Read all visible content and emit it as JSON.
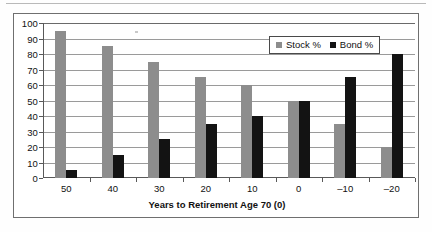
{
  "chart_data": {
    "type": "bar",
    "title": "",
    "xlabel": "Years to Retirement Age 70 (0)",
    "ylabel": "",
    "categories": [
      "50",
      "40",
      "30",
      "20",
      "10",
      "0",
      "–10",
      "–20"
    ],
    "series": [
      {
        "name": "Stock %",
        "color": "#8d8d8d",
        "values": [
          95,
          85,
          75,
          65,
          60,
          50,
          35,
          20
        ]
      },
      {
        "name": "Bond %",
        "color": "#131313",
        "values": [
          5,
          15,
          25,
          35,
          40,
          50,
          65,
          80
        ]
      }
    ],
    "ylim": [
      0,
      100
    ],
    "ytick_step": 10,
    "yticks": [
      "0",
      "10",
      "20",
      "30",
      "40",
      "50",
      "60",
      "70",
      "80",
      "90",
      "100"
    ],
    "grid": "horizontal",
    "legend_position": "top-right",
    "legend_entries": [
      "Stock %",
      "Bond %"
    ],
    "annotations": []
  },
  "figure": {
    "frame_border_color": "#6f6f6f",
    "axis_color": "#595959",
    "gridline_color": "#9a9a9a",
    "background": "#ffffff"
  }
}
